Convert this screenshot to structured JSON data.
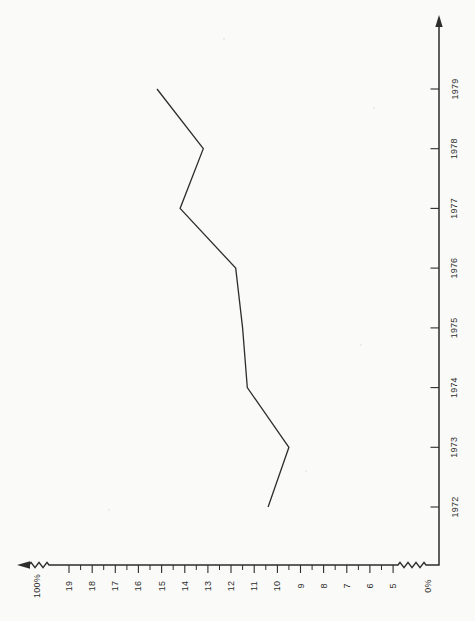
{
  "page": {
    "background": "#fafaf8",
    "ink": "#2d2d2c"
  },
  "chart_data": {
    "type": "line",
    "title": "",
    "rotated_90_ccw": true,
    "grid": false,
    "legend": false,
    "categories": [
      1972,
      1973,
      1974,
      1975,
      1976,
      1977,
      1978,
      1979
    ],
    "series": [
      {
        "name": "percent-line",
        "values": [
          10.4,
          9.5,
          11.3,
          11.5,
          11.8,
          14.2,
          13.2,
          15.2
        ]
      }
    ],
    "value_axis": {
      "unit": "%",
      "ylim": [
        0,
        100
      ],
      "end_labels": {
        "zero": "0%",
        "hundred": "100%"
      },
      "major_ticks": [
        19,
        18,
        17,
        16,
        15,
        14,
        13,
        12,
        11,
        10,
        9,
        8,
        7,
        6,
        5
      ],
      "minor_ticks": [
        18.5,
        17.5,
        16.5,
        15.5,
        14.5,
        13.5,
        12.5,
        11.5,
        10.5,
        9.5,
        8.5,
        7.5,
        6.5,
        5.5
      ],
      "has_scale_breaks": true,
      "arrow_at_hundred_end": true
    },
    "year_axis": {
      "ticks": [
        1972,
        1973,
        1974,
        1975,
        1976,
        1977,
        1978,
        1979
      ],
      "arrow_at_latest_end": true
    }
  }
}
